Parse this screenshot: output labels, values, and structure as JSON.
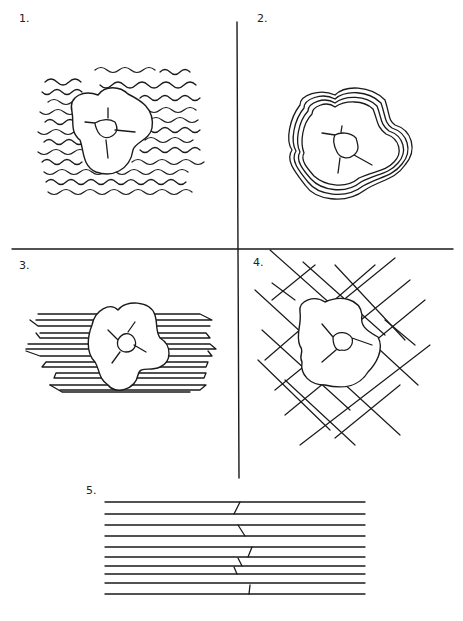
{
  "figure": {
    "panels": [
      {
        "id": 1,
        "label": "1.",
        "description": "Granule with random wavy/crimped collagen fibres surrounding it"
      },
      {
        "id": 2,
        "label": "2.",
        "description": "Granule encircled by concentric layered fibres"
      },
      {
        "id": 3,
        "label": "3.",
        "description": "Granule with parallel fibres running horizontally, fibre ends tapered"
      },
      {
        "id": 4,
        "label": "4.",
        "description": "Granule within a criss-cross lattice of fibres"
      },
      {
        "id": 5,
        "label": "5.",
        "description": "Parallel horizontal fibres with staggered oblique joints"
      }
    ]
  },
  "colors": {
    "stroke": "#1a1a1a",
    "background": "#ffffff"
  }
}
